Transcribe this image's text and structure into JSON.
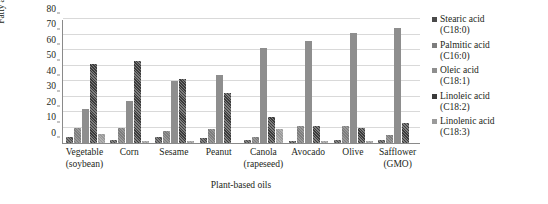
{
  "chart_data": {
    "type": "bar",
    "title": "",
    "xlabel": "Plant-based oils",
    "ylabel": "Fatty acid percentage (%)",
    "ylim": [
      0,
      80
    ],
    "yticks": [
      0,
      10,
      20,
      30,
      40,
      50,
      60,
      70,
      80
    ],
    "grid": true,
    "legend_position": "right",
    "categories": [
      "Vegetable (soybean)",
      "Corn",
      "Sesame",
      "Peanut",
      "Canola (rapeseed)",
      "Avocado",
      "Olive",
      "Safflower (GMO)"
    ],
    "category_lines": [
      [
        "Vegetable",
        "(soybean)"
      ],
      [
        "Corn",
        ""
      ],
      [
        "Sesame",
        ""
      ],
      [
        "Peanut",
        ""
      ],
      [
        "Canola",
        "(rapeseed)"
      ],
      [
        "Avocado",
        ""
      ],
      [
        "Olive",
        ""
      ],
      [
        "Safflower",
        "(GMO)"
      ]
    ],
    "series": [
      {
        "name": "Stearic acid (C18:0)",
        "name_line1": "Stearic acid",
        "name_line2": "(C18:0)",
        "color": "#4a4a4a",
        "values": [
          4,
          2,
          4,
          3,
          2,
          1,
          2,
          2
        ]
      },
      {
        "name": "Palmitic acid (C16:0)",
        "name_line1": "Palmitic acid",
        "name_line2": "(C16:0)",
        "color": "#7d7d7d",
        "values": [
          10,
          10,
          8,
          9,
          4,
          11,
          11,
          5
        ]
      },
      {
        "name": "Oleic acid (C18:1)",
        "name_line1": "Oleic acid",
        "name_line2": "(C18:1)",
        "color": "#8e8e8e",
        "values": [
          22,
          27,
          40,
          44,
          61,
          66,
          71,
          74
        ]
      },
      {
        "name": "Linoleic acid (C18:2)",
        "name_line1": "Linoleic acid",
        "name_line2": "(C18:2)",
        "color": "#3b3b3b",
        "values": [
          51,
          53,
          41,
          32,
          17,
          11,
          10,
          13
        ]
      },
      {
        "name": "Linolenic acid (C18:3)",
        "name_line1": "Linolenic acid",
        "name_line2": "(C18:3)",
        "color": "#9a9a9a",
        "values": [
          6,
          1,
          1,
          0,
          9,
          1,
          1,
          0
        ]
      }
    ]
  }
}
